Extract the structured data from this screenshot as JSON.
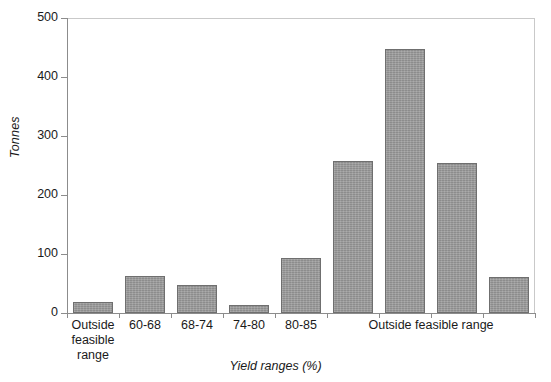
{
  "chart_data": {
    "type": "bar",
    "title": "",
    "xlabel": "Yield ranges (%)",
    "ylabel": "Tonnes",
    "ylim": [
      0,
      500
    ],
    "yticks": [
      0,
      100,
      200,
      300,
      400,
      500
    ],
    "ytick_labels": [
      "0",
      "100",
      "200",
      "300",
      "400",
      "500"
    ],
    "grid": false,
    "legend": "none",
    "categories": [
      "Outside feasible range",
      "60-68",
      "68-74",
      "74-80",
      "80-85",
      "Outside feasible range",
      "Outside feasible range",
      "Outside feasible range",
      "Outside feasible range"
    ],
    "values": [
      19,
      63,
      48,
      14,
      94,
      258,
      447,
      254,
      61
    ],
    "bar_color": "#9b9b9b",
    "bar_edge_color": "#6f6f6f",
    "axis_color": "#8c8c8c"
  },
  "axes": {
    "y_title": "Tonnes",
    "x_title": "Yield ranges (%)",
    "y_tick_labels": [
      {
        "value": 500,
        "text": "500"
      },
      {
        "value": 400,
        "text": "400"
      },
      {
        "value": 300,
        "text": "300"
      },
      {
        "value": 200,
        "text": "200"
      },
      {
        "value": 100,
        "text": "100"
      },
      {
        "value": 0,
        "text": "0"
      }
    ]
  },
  "x_category_labels": [
    {
      "id": "cat-outside-left",
      "lines": [
        "Outside",
        "feasible",
        "range"
      ],
      "text": "Outside feasible range"
    },
    {
      "id": "cat-60-68",
      "lines": [
        "60-68"
      ],
      "text": "60-68"
    },
    {
      "id": "cat-68-74",
      "lines": [
        "68-74"
      ],
      "text": "68-74"
    },
    {
      "id": "cat-74-80",
      "lines": [
        "74-80"
      ],
      "text": "74-80"
    },
    {
      "id": "cat-80-85",
      "lines": [
        "80-85"
      ],
      "text": "80-85"
    },
    {
      "id": "cat-outside-right",
      "lines": [
        "Outside feasible range"
      ],
      "text": "Outside feasible range"
    }
  ],
  "x_label_text": {
    "outside_left_l1": "Outside",
    "outside_left_l2": "feasible",
    "outside_left_l3": "range",
    "r60_68": "60-68",
    "r68_74": "68-74",
    "r74_80": "74-80",
    "r80_85": "80-85",
    "outside_right": "Outside feasible range"
  }
}
